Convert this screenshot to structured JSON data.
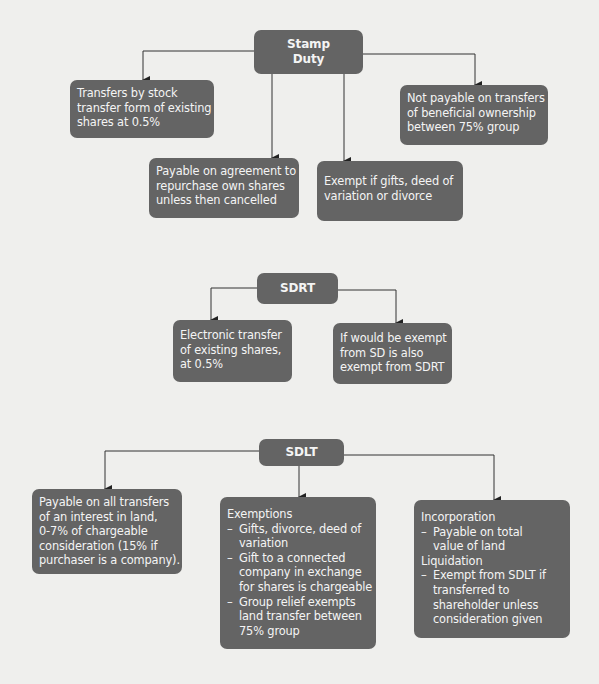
{
  "colors": {
    "box": "#646464",
    "text": "#f4f4f4",
    "line": "#333333",
    "background": "#efefed"
  },
  "stamp_duty": {
    "title_line1": "Stamp",
    "title_line2": "Duty",
    "children": [
      {
        "lines": [
          "Transfers by stock",
          "transfer form of existing",
          "shares at 0.5%"
        ]
      },
      {
        "lines": [
          "Payable on agreement to",
          "repurchase own shares",
          "unless then cancelled"
        ]
      },
      {
        "lines": [
          "Exempt if gifts, deed of",
          "variation or divorce"
        ]
      },
      {
        "lines": [
          "Not payable on transfers",
          "of beneficial ownership",
          "between 75% group"
        ]
      }
    ]
  },
  "sdrt": {
    "title": "SDRT",
    "children": [
      {
        "lines": [
          "Electronic transfer",
          "of existing shares,",
          "at 0.5%"
        ]
      },
      {
        "lines": [
          "If would be exempt",
          "from SD is also",
          "exempt from SDRT"
        ]
      }
    ]
  },
  "sdlt": {
    "title": "SDLT",
    "children": [
      {
        "lines": [
          "Payable on all transfers",
          "of an interest in land,",
          "0-7% of chargeable",
          "consideration (15% if",
          "purchaser is a company)."
        ]
      },
      {
        "heading": "Exemptions",
        "bullets": [
          [
            "Gifts, divorce, deed of",
            "variation"
          ],
          [
            "Gift to a connected",
            "company in exchange",
            "for shares is chargeable"
          ],
          [
            "Group relief exempts",
            "land transfer between",
            "75% group"
          ]
        ]
      },
      {
        "heading1": "Incorporation",
        "bullets1": [
          [
            "Payable on total",
            "value of land"
          ]
        ],
        "heading2": "Liquidation",
        "bullets2": [
          [
            "Exempt from SDLT if",
            "transferred to",
            "shareholder unless",
            "consideration given"
          ]
        ]
      }
    ]
  }
}
